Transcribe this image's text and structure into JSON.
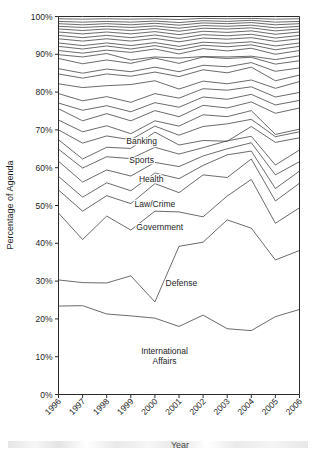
{
  "chart_data": {
    "type": "area",
    "title": "",
    "xlabel": "Year",
    "ylabel": "Percentage of Agenda",
    "categories": [
      1996,
      1997,
      1998,
      1999,
      2000,
      2001,
      2002,
      2003,
      2004,
      2005,
      2006
    ],
    "x": [
      "1996",
      "1997",
      "1998",
      "1999",
      "2000",
      "2001",
      "2002",
      "2003",
      "2004",
      "2005",
      "2006"
    ],
    "xlim": [
      1996,
      2006
    ],
    "ylim": [
      0,
      100
    ],
    "yticks": [
      0,
      10,
      20,
      30,
      40,
      50,
      60,
      70,
      80,
      90,
      100
    ],
    "ytick_labels": [
      "0%",
      "10%",
      "20%",
      "30%",
      "40%",
      "50%",
      "60%",
      "70%",
      "80%",
      "90%",
      "100%"
    ],
    "xtick_labels": [
      "1996",
      "1997",
      "1998",
      "1999",
      "2000",
      "2001",
      "2002",
      "2003",
      "2004",
      "2005",
      "2006"
    ],
    "grid": false,
    "legend": "inline-annotations",
    "stacked": true,
    "cumulative_boundaries": [
      {
        "name": "International Affairs",
        "values": [
          23.4,
          23.5,
          21.3,
          20.8,
          20.2,
          18.0,
          21.0,
          17.4,
          16.9,
          20.6,
          22.5
        ]
      },
      {
        "name": "Defense",
        "values": [
          30.3,
          29.6,
          29.5,
          31.4,
          24.5,
          39.2,
          40.3,
          46.2,
          44.0,
          35.6,
          38.1
        ]
      },
      {
        "name": "Government",
        "values": [
          48.0,
          41.0,
          47.2,
          43.5,
          48.5,
          48.3,
          47.0,
          52.5,
          56.9,
          45.3,
          49.4
        ]
      },
      {
        "name": "Law/Crime",
        "values": [
          54.1,
          48.5,
          52.6,
          50.5,
          55.8,
          53.4,
          58.1,
          57.4,
          62.3,
          51.2,
          55.9
        ]
      },
      {
        "name": "Health",
        "values": [
          57.7,
          52.2,
          56.0,
          53.9,
          58.6,
          57.1,
          60.6,
          63.4,
          64.4,
          54.5,
          59.1
        ]
      },
      {
        "name": "Sports",
        "values": [
          61.7,
          56.2,
          59.4,
          57.8,
          61.4,
          60.3,
          63.1,
          65.0,
          66.6,
          58.1,
          61.6
        ]
      },
      {
        "name": "Banking",
        "values": [
          64.9,
          59.9,
          62.9,
          62.4,
          65.4,
          63.6,
          65.3,
          67.1,
          68.3,
          60.7,
          64.7
        ]
      },
      {
        "name": "Band 8",
        "values": [
          67.4,
          62.3,
          65.4,
          65.1,
          69.4,
          66.0,
          67.2,
          67.0,
          70.9,
          66.7,
          67.9
        ]
      },
      {
        "name": "Band 9",
        "values": [
          70.0,
          66.5,
          68.4,
          67.4,
          71.0,
          68.6,
          70.9,
          71.6,
          72.8,
          68.2,
          69.5
        ]
      },
      {
        "name": "Band 10",
        "values": [
          72.6,
          69.5,
          71.1,
          69.0,
          72.4,
          71.0,
          74.0,
          73.5,
          75.1,
          68.8,
          70.2
        ]
      },
      {
        "name": "Band 11",
        "values": [
          75.6,
          72.4,
          74.3,
          72.4,
          75.1,
          73.5,
          76.5,
          75.8,
          77.4,
          74.4,
          75.8
        ]
      },
      {
        "name": "Band 12",
        "values": [
          77.1,
          75.2,
          76.4,
          74.8,
          77.2,
          76.0,
          78.7,
          78.1,
          79.4,
          76.6,
          77.8
        ]
      },
      {
        "name": "Band 13",
        "values": [
          79.6,
          77.7,
          78.8,
          77.3,
          79.6,
          78.4,
          80.9,
          80.5,
          81.4,
          78.7,
          79.9
        ]
      },
      {
        "name": "Band 14",
        "values": [
          82.2,
          81.2,
          81.7,
          82.0,
          83.0,
          80.8,
          82.9,
          82.2,
          83.2,
          81.0,
          82.8
        ]
      },
      {
        "name": "Band 15",
        "values": [
          84.8,
          83.7,
          84.8,
          84.2,
          85.3,
          84.1,
          85.9,
          85.1,
          86.6,
          83.0,
          84.5
        ]
      },
      {
        "name": "Band 16",
        "values": [
          86.2,
          85.0,
          86.1,
          85.4,
          86.6,
          85.4,
          87.1,
          86.7,
          87.8,
          85.5,
          86.4
        ]
      },
      {
        "name": "Band 17",
        "values": [
          88.9,
          87.5,
          88.5,
          87.6,
          89.0,
          87.6,
          89.3,
          88.9,
          89.2,
          87.4,
          88.3
        ]
      },
      {
        "name": "Band 18",
        "values": [
          89.9,
          89.3,
          90.2,
          88.5,
          89.3,
          89.0,
          89.4,
          89.3,
          89.5,
          88.6,
          89.6
        ]
      },
      {
        "name": "Band 19",
        "values": [
          91.0,
          90.3,
          91.1,
          90.5,
          91.4,
          90.1,
          91.5,
          90.9,
          91.6,
          90.0,
          91.0
        ]
      },
      {
        "name": "Band 20",
        "values": [
          92.1,
          91.4,
          92.2,
          91.4,
          92.3,
          91.2,
          92.4,
          92.0,
          92.5,
          91.2,
          92.1
        ]
      },
      {
        "name": "Band 21",
        "values": [
          93.0,
          92.3,
          93.0,
          92.3,
          93.1,
          92.1,
          93.2,
          92.9,
          93.3,
          92.2,
          93.0
        ]
      },
      {
        "name": "Band 22",
        "values": [
          94.1,
          93.5,
          94.1,
          93.5,
          94.2,
          93.3,
          94.3,
          94.0,
          94.4,
          93.4,
          94.1
        ]
      },
      {
        "name": "Band 23",
        "values": [
          95.0,
          94.4,
          95.0,
          94.4,
          95.1,
          94.2,
          95.2,
          94.9,
          95.3,
          94.3,
          95.0
        ]
      },
      {
        "name": "Band 24",
        "values": [
          95.9,
          95.4,
          95.9,
          95.4,
          96.0,
          95.2,
          96.1,
          95.8,
          96.2,
          95.3,
          95.9
        ]
      },
      {
        "name": "Band 25",
        "values": [
          96.7,
          96.3,
          96.7,
          96.3,
          96.8,
          96.1,
          96.9,
          96.7,
          97.0,
          96.2,
          96.7
        ]
      },
      {
        "name": "Band 26",
        "values": [
          97.4,
          97.1,
          97.4,
          97.1,
          97.5,
          96.9,
          97.6,
          97.4,
          97.7,
          97.0,
          97.4
        ]
      },
      {
        "name": "Band 27",
        "values": [
          98.1,
          97.8,
          98.1,
          97.8,
          98.2,
          97.7,
          98.3,
          98.1,
          98.4,
          97.8,
          98.1
        ]
      },
      {
        "name": "Band 28",
        "values": [
          98.7,
          98.5,
          98.7,
          98.5,
          98.8,
          98.4,
          98.9,
          98.7,
          99.0,
          98.5,
          98.7
        ]
      },
      {
        "name": "Band 29",
        "values": [
          99.4,
          99.3,
          99.4,
          99.3,
          99.4,
          99.2,
          99.5,
          99.4,
          99.5,
          99.3,
          99.4
        ]
      },
      {
        "name": "Total",
        "values": [
          100,
          100,
          100,
          100,
          100,
          100,
          100,
          100,
          100,
          100,
          100
        ]
      }
    ],
    "annotations": [
      {
        "text": "Banking",
        "x": 1999.45,
        "y": 66.4
      },
      {
        "text": "Sports",
        "x": 1999.45,
        "y": 61.3
      },
      {
        "text": "Health",
        "x": 1999.85,
        "y": 56.2
      },
      {
        "text": "Law/Crime",
        "x": 2000.0,
        "y": 49.7
      },
      {
        "text": "Government",
        "x": 2000.2,
        "y": 43.4
      },
      {
        "text": "Defense",
        "x": 2001.1,
        "y": 28.8
      },
      {
        "text": "International",
        "x": 2000.4,
        "y": 10.6
      },
      {
        "text": "Affairs",
        "x": 2000.4,
        "y": 8.1
      }
    ]
  },
  "axes": {
    "y_title": "Percentage of Agenda",
    "x_title": "Year"
  }
}
